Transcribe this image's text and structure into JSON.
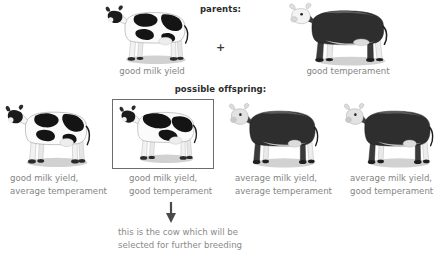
{
  "diagram": {
    "title_parents": "parents:",
    "title_offspring": "possible offspring:",
    "cross_symbol": "+",
    "parents": [
      {
        "id": "parent-cow",
        "label": "good milk yield",
        "breed": "holstein",
        "sex": "cow",
        "trait": "good milk yield"
      },
      {
        "id": "parent-bull",
        "label": "good temperament",
        "breed": "hereford",
        "sex": "bull",
        "trait": "good temperament"
      }
    ],
    "offspring": [
      {
        "id": "offspring-1",
        "breed": "holstein",
        "selected": false,
        "label_line1": "good milk yield,",
        "label_line2": "average temperament"
      },
      {
        "id": "offspring-2",
        "breed": "holstein",
        "selected": true,
        "label_line1": "good milk yield,",
        "label_line2": "good temperament"
      },
      {
        "id": "offspring-3",
        "breed": "hereford",
        "selected": false,
        "label_line1": "average milk yield,",
        "label_line2": "average temperament"
      },
      {
        "id": "offspring-4",
        "breed": "hereford",
        "selected": false,
        "label_line1": "average milk yield,",
        "label_line2": "good temperament"
      }
    ],
    "caption": {
      "line1": "this is the cow which will be",
      "line2": "selected for further breeding"
    },
    "colors": {
      "background": "#ffffff",
      "heading_text": "#2b2b2b",
      "label_text": "#848484",
      "caption_text": "#8a8a8a",
      "selection_box_border": "#6d6d6d",
      "arrow": "#4a4a4a",
      "shadow": "#c9c9c9"
    }
  }
}
